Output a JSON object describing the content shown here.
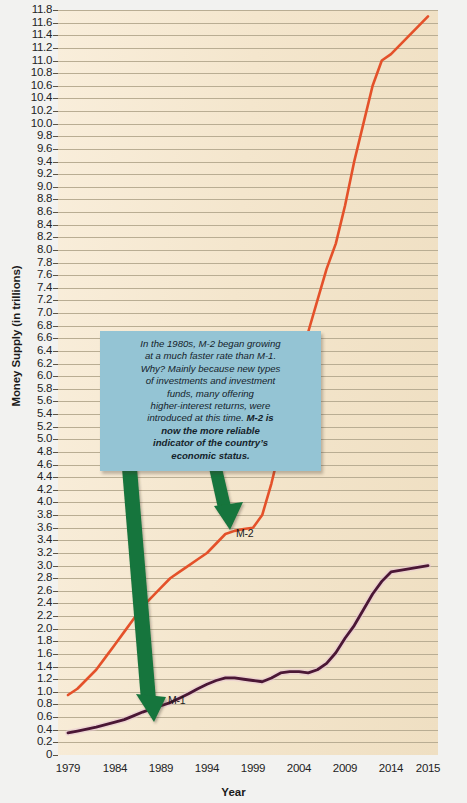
{
  "chart_data": {
    "type": "line",
    "title": "",
    "xlabel": "Year",
    "ylabel": "Money Supply (in trillions)",
    "ylim": [
      0,
      11.8
    ],
    "y_tick_step": 0.2,
    "grid": true,
    "legend": "inline-labels",
    "x_ticks": [
      "1979",
      "1984",
      "1989",
      "1994",
      "1999",
      "2004",
      "2009",
      "2014",
      "2015"
    ],
    "y_ticks": [
      "11.8",
      "11.6",
      "11.4",
      "11.2",
      "11.0",
      "10.8",
      "10.6",
      "10.4",
      "10.2",
      "10.0",
      "9.8",
      "9.6",
      "9.4",
      "9.2",
      "9.0",
      "8.8",
      "8.6",
      "8.4",
      "8.2",
      "8.0",
      "7.8",
      "7.6",
      "7.4",
      "7.2",
      "7.0",
      "6.8",
      "6.6",
      "6.4",
      "6.2",
      "6.0",
      "5.8",
      "5.6",
      "5.4",
      "5.2",
      "5.0",
      "4.8",
      "4.6",
      "4.4",
      "4.2",
      "4.0",
      "3.8",
      "3.6",
      "3.4",
      "3.2",
      "3.0",
      "2.8",
      "2.6",
      "2.4",
      "2.2",
      "2.0",
      "1.8",
      "1.6",
      "1.4",
      "1.2",
      "1.0",
      "0.8",
      "0.6",
      "0.4",
      "0.2",
      "0"
    ],
    "series": [
      {
        "name": "M-2",
        "color": "#E4512A",
        "x": [
          1979,
          1980,
          1981,
          1982,
          1983,
          1984,
          1985,
          1986,
          1987,
          1988,
          1989,
          1990,
          1991,
          1992,
          1993,
          1994,
          1995,
          1996,
          1997,
          1998,
          1999,
          2000,
          2001,
          2002,
          2003,
          2004,
          2005,
          2006,
          2007,
          2008,
          2009,
          2010,
          2011,
          2012,
          2013,
          2014,
          2015
        ],
        "values": [
          0.95,
          1.05,
          1.2,
          1.35,
          1.55,
          1.75,
          1.95,
          2.15,
          2.35,
          2.5,
          2.65,
          2.8,
          2.9,
          3.0,
          3.1,
          3.2,
          3.35,
          3.5,
          3.55,
          3.58,
          3.6,
          3.8,
          4.3,
          4.9,
          5.6,
          6.2,
          6.7,
          7.2,
          7.7,
          8.1,
          8.7,
          9.4,
          10.0,
          10.6,
          11.0,
          11.1,
          11.7
        ]
      },
      {
        "name": "M-1",
        "color": "#4B1735",
        "x": [
          1979,
          1980,
          1981,
          1982,
          1983,
          1984,
          1985,
          1986,
          1987,
          1988,
          1989,
          1990,
          1991,
          1992,
          1993,
          1994,
          1995,
          1996,
          1997,
          1998,
          1999,
          2000,
          2001,
          2002,
          2003,
          2004,
          2005,
          2006,
          2007,
          2008,
          2009,
          2010,
          2011,
          2012,
          2013,
          2014,
          2015
        ],
        "values": [
          0.35,
          0.38,
          0.41,
          0.44,
          0.48,
          0.52,
          0.56,
          0.62,
          0.68,
          0.73,
          0.78,
          0.83,
          0.9,
          0.97,
          1.05,
          1.12,
          1.18,
          1.22,
          1.22,
          1.2,
          1.18,
          1.16,
          1.22,
          1.3,
          1.32,
          1.32,
          1.3,
          1.35,
          1.45,
          1.62,
          1.85,
          2.05,
          2.3,
          2.55,
          2.75,
          2.9,
          3.0
        ]
      }
    ],
    "annotations": [
      {
        "id": "m2-callout",
        "text_plain": "In the 1980s, M-2 began growing at a much faster rate than M-1. Why? Mainly because new types of investments and investment funds, many offering higher-interest returns, were introduced at this time. M-2 is now the more reliable indicator of the country's economic status.",
        "lines": [
          {
            "text": "In the 1980s, M-2 began growing",
            "bold": false
          },
          {
            "text": "at a much faster rate than M-1.",
            "bold": false
          },
          {
            "text": "Why? Mainly because new types",
            "bold": false
          },
          {
            "text": "of investments and investment",
            "bold": false
          },
          {
            "text": "funds, many offering",
            "bold": false
          },
          {
            "text": "higher-interest returns, were",
            "bold": false
          },
          {
            "text": "introduced at this time. ",
            "bold": false,
            "trailing_bold": "M-2 is"
          },
          {
            "text": "now the more reliable",
            "bold": true
          },
          {
            "text": "indicator of the country’s",
            "bold": true
          },
          {
            "text": "economic status.",
            "bold": true
          }
        ],
        "box_color": "#94c4d4",
        "text_color": "#14232b"
      }
    ],
    "arrows": [
      {
        "id": "arrow-to-m1",
        "label": "M-1",
        "color": "#16743C",
        "points_to": "M-1 line near 1989"
      },
      {
        "id": "arrow-to-m2",
        "label": "M-2",
        "color": "#16743C",
        "points_to": "M-2 line near 1999"
      }
    ]
  }
}
